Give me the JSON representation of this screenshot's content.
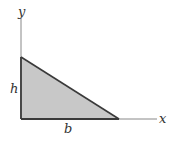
{
  "diagram": {
    "axes": {
      "x_label": "x",
      "y_label": "y"
    },
    "shape": {
      "type": "right-triangle",
      "fill": "#c8c8c8",
      "stroke": "#3a3a3a"
    },
    "dimensions": {
      "height_label": "h",
      "base_label": "b"
    }
  }
}
